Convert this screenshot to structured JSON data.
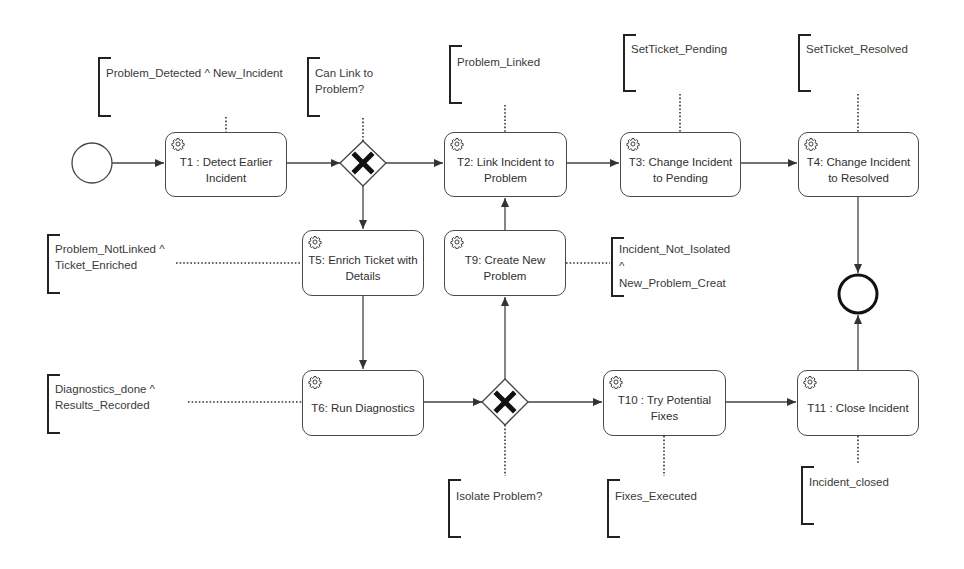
{
  "diagram": {
    "type": "BPMN process",
    "start_event": {
      "label": ""
    },
    "end_event": {
      "label": ""
    },
    "tasks": [
      {
        "id": "T1",
        "label": "T1 : Detect Earlier Incident",
        "icon": "gear-icon"
      },
      {
        "id": "T2",
        "label": "T2: Link Incident to Problem",
        "icon": "gear-icon"
      },
      {
        "id": "T3",
        "label": "T3: Change Incident to Pending",
        "icon": "gear-icon"
      },
      {
        "id": "T4",
        "label": "T4: Change Incident to Resolved",
        "icon": "gear-icon"
      },
      {
        "id": "T5",
        "label": "T5: Enrich Ticket with Details",
        "icon": "gear-icon"
      },
      {
        "id": "T9",
        "label": "T9: Create New Problem",
        "icon": "gear-icon"
      },
      {
        "id": "T6",
        "label": "T6: Run Diagnostics",
        "icon": "gear-icon"
      },
      {
        "id": "T10",
        "label": "T10 : Try Potential Fixes",
        "icon": "gear-icon"
      },
      {
        "id": "T11",
        "label": "T11 : Close Incident",
        "icon": "gear-icon"
      }
    ],
    "gateways": [
      {
        "id": "G1",
        "type": "exclusive",
        "icon": "x-icon"
      },
      {
        "id": "G2",
        "type": "exclusive",
        "icon": "x-icon"
      }
    ],
    "annotations": [
      {
        "id": "A1",
        "text": "Problem_Detected ^ New_Incident",
        "attached_to": "T1"
      },
      {
        "id": "A2",
        "text": "Can Link to\nProblem?",
        "attached_to": "G1"
      },
      {
        "id": "A3",
        "text": "Problem_Linked",
        "attached_to": "T2"
      },
      {
        "id": "A4",
        "text": "SetTicket_Pending",
        "attached_to": "T3"
      },
      {
        "id": "A5",
        "text": "SetTicket_Resolved",
        "attached_to": "T4"
      },
      {
        "id": "A6",
        "text": "Problem_NotLinked ^\nTicket_Enriched",
        "attached_to": "T5"
      },
      {
        "id": "A7",
        "text": "Incident_Not_Isolated\n^\nNew_Problem_Creat",
        "attached_to": "T9"
      },
      {
        "id": "A8",
        "text": "Diagnostics_done ^\nResults_Recorded",
        "attached_to": "T6"
      },
      {
        "id": "A9",
        "text": "Isolate Problem?",
        "attached_to": "G2"
      },
      {
        "id": "A10",
        "text": "Fixes_Executed",
        "attached_to": "T10"
      },
      {
        "id": "A11",
        "text": "Incident_closed",
        "attached_to": "T11"
      }
    ],
    "flows": [
      [
        "Start",
        "T1"
      ],
      [
        "T1",
        "G1"
      ],
      [
        "G1",
        "T2"
      ],
      [
        "G1",
        "T5"
      ],
      [
        "T2",
        "T3"
      ],
      [
        "T3",
        "T4"
      ],
      [
        "T4",
        "End"
      ],
      [
        "T5",
        "T6"
      ],
      [
        "T6",
        "G2"
      ],
      [
        "G2",
        "T9"
      ],
      [
        "G2",
        "T10"
      ],
      [
        "T9",
        "T2"
      ],
      [
        "T10",
        "T11"
      ],
      [
        "T11",
        "End"
      ]
    ],
    "colors": {
      "stroke": "#4a4a4a",
      "text": "#333333",
      "background": "#ffffff"
    }
  }
}
